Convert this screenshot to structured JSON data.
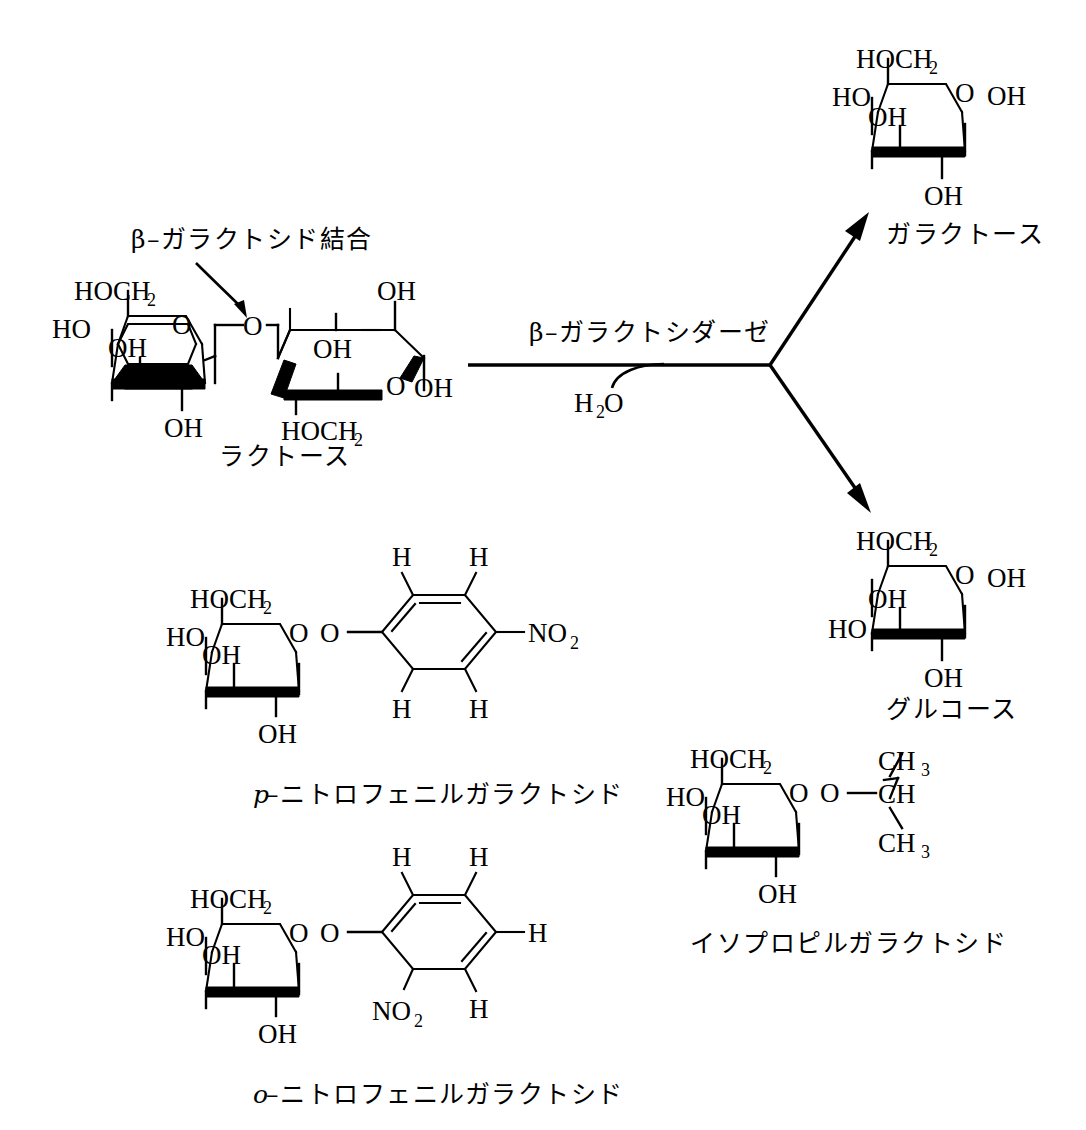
{
  "diagram": {
    "background_color": "#ffffff",
    "ink_color": "#000000"
  },
  "reaction": {
    "enzyme_label": "β–ガラクトシダーゼ",
    "cosubstrate": {
      "formula": "H",
      "subscript": "2",
      "element": "O"
    },
    "bond_callout": "β–ガラクトシド結合"
  },
  "molecules": {
    "lactose": {
      "name": "ラクトース",
      "galactose_unit": {
        "c6": "HOCH",
        "c6_sub": "2",
        "c4_oh": "HO",
        "ring_o": "O",
        "c3_oh": "OH",
        "c2_oh": "OH"
      },
      "glucose_unit": {
        "c3_oh": "OH",
        "c2_oh": "OH",
        "ring_o": "O",
        "anomeric_oh": "OH",
        "c6": "HOCH",
        "c6_sub": "2"
      },
      "glycosidic_o": "O"
    },
    "galactose": {
      "name": "ガラクトース",
      "c6": "HOCH",
      "c6_sub": "2",
      "c4_oh": "HO",
      "ring_o": "O",
      "anomeric_oh": "OH",
      "c3_oh": "OH",
      "c2_oh": "OH"
    },
    "glucose": {
      "name": "グルコース",
      "c6": "HOCH",
      "c6_sub": "2",
      "c4_oh": "HO",
      "ring_o": "O",
      "anomeric_oh": "OH",
      "c3_oh": "OH",
      "c2_oh": "OH"
    },
    "p_nitrophenyl_galactoside": {
      "name_italic": "p",
      "name_rest": "–ニトロフェニルガラクトシド",
      "c6": "HOCH",
      "c6_sub": "2",
      "c4_oh": "HO",
      "ring_o": "O",
      "glycosidic_o": "O",
      "c3_oh": "OH",
      "c2_oh": "OH",
      "ring_h": [
        "H",
        "H",
        "H",
        "H"
      ],
      "nitro": "NO",
      "nitro_sub": "2"
    },
    "o_nitrophenyl_galactoside": {
      "name_italic": "o",
      "name_rest": "–ニトロフェニルガラクトシド",
      "c6": "HOCH",
      "c6_sub": "2",
      "c4_oh": "HO",
      "ring_o": "O",
      "glycosidic_o": "O",
      "c3_oh": "OH",
      "c2_oh": "OH",
      "ring_h": [
        "H",
        "H",
        "H",
        "H"
      ],
      "nitro": "NO",
      "nitro_sub": "2"
    },
    "isopropyl_galactoside": {
      "name": "イソプロピルガラクトシド",
      "c6": "HOCH",
      "c6_sub": "2",
      "c4_oh": "HO",
      "ring_o": "O",
      "glycosidic_o": "O",
      "c3_oh": "OH",
      "c2_oh": "OH",
      "methine": "CH",
      "methyl_top": "CH",
      "methyl_top_sub": "3",
      "methyl_bottom": "CH",
      "methyl_bottom_sub": "3"
    }
  }
}
